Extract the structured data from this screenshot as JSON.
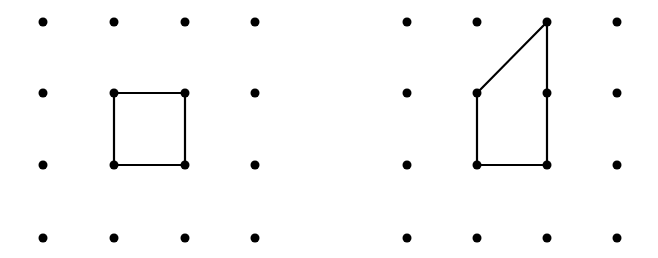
{
  "figure": {
    "background": "#ffffff",
    "ink_color": "#000000",
    "dot_radius": 4.5,
    "line_width": 2.2,
    "grids": [
      {
        "name": "left-geoboard",
        "xs": [
          43,
          114,
          185,
          255
        ],
        "ys": [
          22,
          93,
          165,
          238
        ],
        "shape": {
          "name": "square",
          "points": [
            [
              114,
              93
            ],
            [
              185,
              93
            ],
            [
              185,
              165
            ],
            [
              114,
              165
            ]
          ]
        }
      },
      {
        "name": "right-geoboard",
        "xs": [
          407,
          477,
          547,
          617
        ],
        "ys": [
          22,
          93,
          165,
          238
        ],
        "shape": {
          "name": "trapezoid",
          "points": [
            [
              547,
              22
            ],
            [
              547,
              165
            ],
            [
              477,
              165
            ],
            [
              477,
              93
            ]
          ]
        }
      }
    ]
  }
}
